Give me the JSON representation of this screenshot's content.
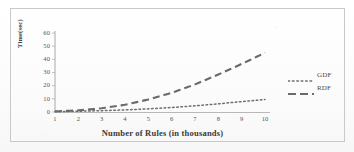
{
  "chart_data": {
    "type": "line",
    "title": "",
    "xlabel": "Number of Rules (in thousands)",
    "ylabel": "Time(sec)",
    "x": [
      1,
      2,
      3,
      4,
      5,
      6,
      7,
      8,
      9,
      10
    ],
    "xtick_labels": [
      "1",
      "2",
      "3",
      "4",
      "5",
      "6",
      "7",
      "8",
      "9",
      "10"
    ],
    "ytick_labels": [
      "0",
      "10",
      "20",
      "30",
      "40",
      "50",
      "60"
    ],
    "ytick_values": [
      0,
      10,
      20,
      30,
      40,
      50,
      60
    ],
    "xlim": [
      1,
      10
    ],
    "ylim": [
      0,
      60
    ],
    "grid": false,
    "legend_position": "right",
    "series": [
      {
        "name": "GDF",
        "style": "dotted",
        "color": "#6e6e6e",
        "values": [
          0.3,
          0.6,
          1.0,
          1.6,
          2.4,
          3.4,
          4.7,
          6.2,
          7.9,
          9.5
        ]
      },
      {
        "name": "RDF",
        "style": "dashed",
        "color": "#6a6a6a",
        "values": [
          0.5,
          1.2,
          2.8,
          5.5,
          9.5,
          14.5,
          21.0,
          28.5,
          36.5,
          45.0
        ]
      }
    ]
  },
  "figure": {
    "y_axis_title": "Time(sec)",
    "x_axis_title": "Number of Rules (in thousands)",
    "legend": [
      {
        "label": "GDF",
        "style": "dotted"
      },
      {
        "label": "RDF",
        "style": "dashed"
      }
    ],
    "colors": {
      "frame": "#c9c9c9",
      "axis": "#9a9a9a",
      "gdf": "#6e6e6e",
      "rdf": "#6a6a6a",
      "text": "#4a4a4a",
      "background": "#fdfdfd"
    }
  }
}
